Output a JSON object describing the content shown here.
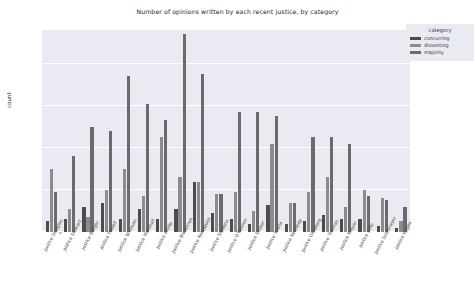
{
  "chart_data": {
    "type": "bar",
    "title": "Number of opinions written by each recent justice, by category",
    "xlabel": "",
    "ylabel": "count",
    "ylim": [
      0,
      480
    ],
    "yticks": [
      0,
      100,
      200,
      300,
      400
    ],
    "grid": true,
    "legend": {
      "title": "category",
      "position": "upper right",
      "entries": [
        "concurring",
        "dissenting",
        "majority"
      ]
    },
    "colors": {
      "concurring": "#4c4c4c",
      "dissenting": "#8c8c8c",
      "majority": "#6b6b6b",
      "plot_background": "#eaeaf2",
      "gridline": "#ffffff",
      "figure_background": "#ffffff"
    },
    "categories": [
      "Justice Douglas",
      "Justice Stewart",
      "Justice Burger",
      "Justice Powell",
      "Justice Brennan",
      "Justice Marshall",
      "Justice White",
      "Justice Blackmun",
      "Justice Rehnquist",
      "Justice Stevens",
      "Justice O'Connor",
      "Justice Souter",
      "Justice Scalia",
      "Justice Kennedy",
      "Justice Ginsburg",
      "Justice Thomas",
      "Justice Breyer",
      "Justice Alito",
      "Justice Sotomayor",
      "Justice Kagan"
    ],
    "series": [
      {
        "name": "concurring",
        "values": [
          25,
          30,
          60,
          70,
          30,
          55,
          30,
          55,
          120,
          45,
          30,
          20,
          65,
          20,
          25,
          40,
          30,
          30,
          15,
          10
        ]
      },
      {
        "name": "dissenting",
        "values": [
          150,
          55,
          35,
          100,
          150,
          85,
          225,
          130,
          120,
          90,
          95,
          50,
          210,
          70,
          95,
          130,
          60,
          100,
          80,
          25
        ]
      },
      {
        "name": "majority",
        "values": [
          95,
          180,
          250,
          240,
          370,
          305,
          265,
          470,
          375,
          90,
          285,
          285,
          275,
          70,
          225,
          225,
          210,
          85,
          75,
          60
        ]
      }
    ]
  }
}
